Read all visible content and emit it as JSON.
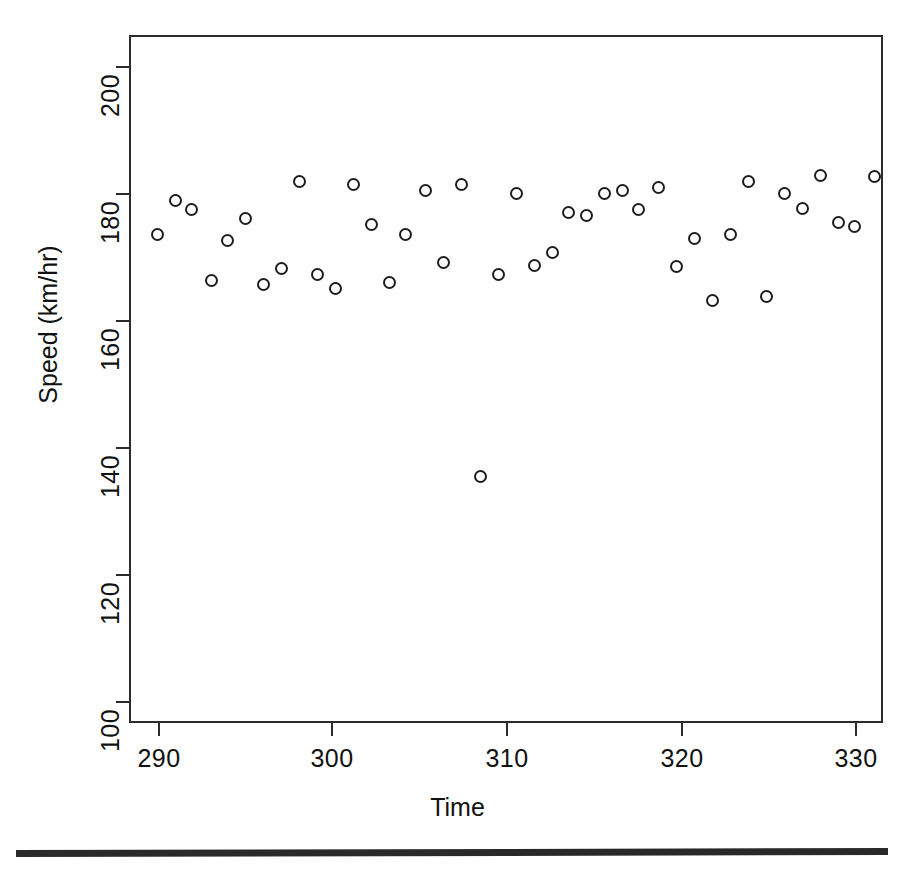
{
  "figure": {
    "title": "",
    "background_color": "#ffffff",
    "ink_color": "#1d1d1d"
  },
  "axis": {
    "xlabel": "Time",
    "ylabel": "Speed (km/hr)",
    "x_ticks": [
      "290",
      "300",
      "310",
      "320",
      "330"
    ],
    "y_ticks": [
      "100",
      "120",
      "140",
      "160",
      "180",
      "200"
    ]
  },
  "chart_data": {
    "type": "scatter",
    "title": "",
    "xlabel": "Time",
    "ylabel": "Speed (km/hr)",
    "xlim": [
      288.3,
      330.3
    ],
    "ylim": [
      97.2,
      208.1
    ],
    "grid": false,
    "legend": null,
    "marker": "open-circle",
    "n_points": 44,
    "x": [
      289.9,
      290.9,
      291.8,
      292.9,
      293.8,
      294.8,
      295.8,
      296.8,
      297.8,
      298.8,
      299.8,
      300.8,
      301.8,
      302.8,
      303.7,
      304.8,
      305.8,
      306.8,
      307.9,
      308.9,
      309.9,
      310.9,
      311.9,
      312.8,
      313.8,
      314.8,
      315.8,
      316.7,
      317.8,
      318.8,
      319.8,
      320.8,
      321.8,
      322.8,
      323.8,
      324.8,
      325.8,
      326.8,
      327.8,
      328.7,
      329.8
    ],
    "y": [
      176.0,
      181.5,
      180.0,
      168.5,
      175.0,
      178.5,
      167.9,
      170.5,
      184.5,
      169.5,
      167.3,
      184.0,
      177.5,
      168.2,
      176.0,
      183.0,
      171.5,
      184.0,
      137.0,
      169.5,
      182.5,
      171.0,
      173.0,
      179.5,
      179.0,
      182.5,
      183.0,
      180.0,
      183.5,
      170.8,
      175.3,
      165.3,
      176.0,
      184.5,
      166.0,
      182.5,
      180.2,
      185.5,
      177.8,
      177.3,
      185.3
    ],
    "points": [
      {
        "x": 289.9,
        "y": 176.0
      },
      {
        "x": 290.9,
        "y": 181.5
      },
      {
        "x": 291.8,
        "y": 180.0
      },
      {
        "x": 292.9,
        "y": 168.5
      },
      {
        "x": 293.8,
        "y": 175.0
      },
      {
        "x": 294.8,
        "y": 178.5
      },
      {
        "x": 295.8,
        "y": 167.9
      },
      {
        "x": 296.8,
        "y": 170.5
      },
      {
        "x": 297.8,
        "y": 184.5
      },
      {
        "x": 298.8,
        "y": 169.5
      },
      {
        "x": 299.8,
        "y": 167.3
      },
      {
        "x": 300.8,
        "y": 184.0
      },
      {
        "x": 301.8,
        "y": 177.5
      },
      {
        "x": 302.8,
        "y": 168.2
      },
      {
        "x": 303.7,
        "y": 176.0
      },
      {
        "x": 304.8,
        "y": 183.0
      },
      {
        "x": 305.8,
        "y": 171.5
      },
      {
        "x": 306.8,
        "y": 184.0
      },
      {
        "x": 307.9,
        "y": 137.0
      },
      {
        "x": 308.9,
        "y": 169.5
      },
      {
        "x": 309.9,
        "y": 182.5
      },
      {
        "x": 310.9,
        "y": 171.0
      },
      {
        "x": 311.9,
        "y": 173.0
      },
      {
        "x": 312.8,
        "y": 179.5
      },
      {
        "x": 313.8,
        "y": 179.0
      },
      {
        "x": 314.8,
        "y": 182.5
      },
      {
        "x": 315.8,
        "y": 183.0
      },
      {
        "x": 316.7,
        "y": 180.0
      },
      {
        "x": 317.8,
        "y": 183.5
      },
      {
        "x": 318.8,
        "y": 170.8
      },
      {
        "x": 319.8,
        "y": 175.3
      },
      {
        "x": 320.8,
        "y": 165.3
      },
      {
        "x": 321.8,
        "y": 176.0
      },
      {
        "x": 322.8,
        "y": 184.5
      },
      {
        "x": 323.8,
        "y": 166.0
      },
      {
        "x": 324.8,
        "y": 182.5
      },
      {
        "x": 325.8,
        "y": 180.2
      },
      {
        "x": 326.8,
        "y": 185.5
      },
      {
        "x": 327.8,
        "y": 177.8
      },
      {
        "x": 328.7,
        "y": 177.3
      },
      {
        "x": 329.8,
        "y": 185.3
      }
    ]
  },
  "geometry": {
    "plot_left_px": 129,
    "plot_right_px": 883,
    "plot_top_px": 35,
    "plot_bottom_px": 723,
    "x_tick_px": [
      159,
      332,
      507,
      682,
      856
    ],
    "y_tick_px": [
      702,
      575,
      448,
      321,
      194,
      67
    ]
  }
}
